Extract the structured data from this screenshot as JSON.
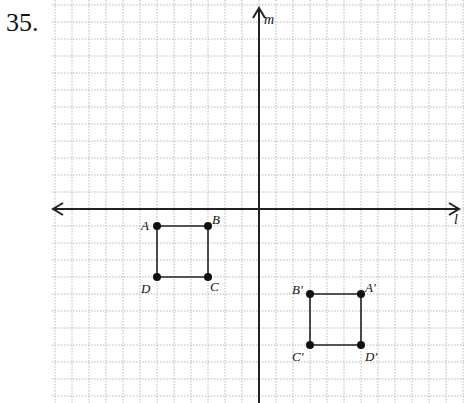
{
  "problem": {
    "number": "35."
  },
  "graph": {
    "origin_px": [
      259,
      209
    ],
    "unit_px": 17,
    "grid_extent_px": {
      "left": 52,
      "right": 464,
      "top": 0,
      "bottom": 403
    },
    "axis_labels": {
      "horizontal": "l",
      "vertical": "m"
    },
    "colors": {
      "grid": "#b8b8b8",
      "axis": "#222222",
      "figure": "#222222"
    }
  },
  "figures": [
    {
      "name": "ABCD",
      "points": [
        {
          "label": "A",
          "coord": [
            -6,
            -1
          ]
        },
        {
          "label": "B",
          "coord": [
            -3,
            -1
          ]
        },
        {
          "label": "C",
          "coord": [
            -3,
            -4
          ]
        },
        {
          "label": "D",
          "coord": [
            -6,
            -4
          ]
        }
      ]
    },
    {
      "name": "A'B'C'D'",
      "points": [
        {
          "label": "A′",
          "coord": [
            6,
            -5
          ]
        },
        {
          "label": "B′",
          "coord": [
            3,
            -5
          ]
        },
        {
          "label": "C′",
          "coord": [
            3,
            -8
          ]
        },
        {
          "label": "D′",
          "coord": [
            6,
            -8
          ]
        }
      ]
    }
  ]
}
